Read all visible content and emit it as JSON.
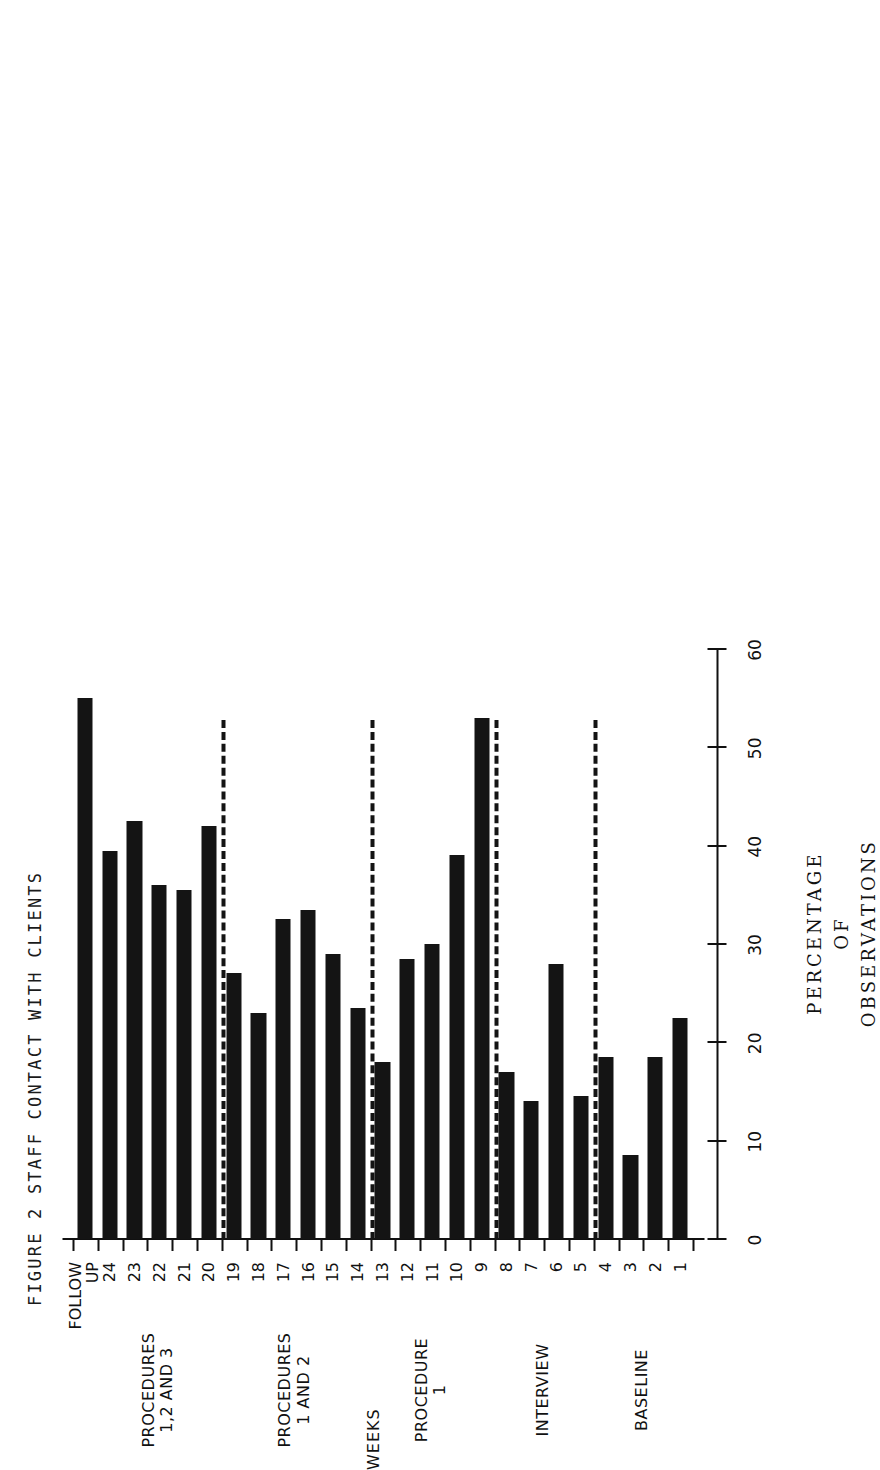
{
  "figure": {
    "title": "FIGURE 2  STAFF CONTACT WITH CLIENTS"
  },
  "chart_data": {
    "type": "bar",
    "title": "FIGURE 2  STAFF CONTACT WITH CLIENTS",
    "orientation": "vertical-bars-printed-sideways",
    "xlabel": "WEEKS",
    "ylabel": "PERCENTAGE OF OBSERVATIONS",
    "ylabel_lines": [
      "PERCENTAGE",
      "OF",
      "OBSERVATIONS"
    ],
    "ylim": [
      0,
      60
    ],
    "yticks": [
      0,
      10,
      20,
      30,
      40,
      50,
      60
    ],
    "ytick_labels": [
      "0",
      "10",
      "20",
      "30",
      "40",
      "50",
      "60"
    ],
    "grid": false,
    "legend": "none",
    "categories": [
      "1",
      "2",
      "3",
      "4",
      "5",
      "6",
      "7",
      "8",
      "9",
      "10",
      "11",
      "12",
      "13",
      "14",
      "15",
      "16",
      "17",
      "18",
      "19",
      "20",
      "21",
      "22",
      "23",
      "24",
      "FOLLOW UP"
    ],
    "values": [
      22.5,
      18.5,
      8.5,
      18.5,
      14.5,
      28,
      14,
      17,
      53,
      39,
      30,
      28.5,
      18,
      23.5,
      29,
      33.5,
      32.5,
      23,
      27,
      42,
      35.5,
      36,
      42.5,
      39.5,
      55
    ],
    "phases": [
      {
        "label": "BASELINE",
        "label_lines": [
          "BASELINE"
        ],
        "start_category": "1",
        "end_category": "4"
      },
      {
        "label": "INTERVIEW",
        "label_lines": [
          "INTERVIEW"
        ],
        "start_category": "5",
        "end_category": "8"
      },
      {
        "label": "PROCEDURE 1",
        "label_lines": [
          "PROCEDURE",
          "1"
        ],
        "start_category": "9",
        "end_category": "13"
      },
      {
        "label": "PROCEDURES 1 AND 2",
        "label_lines": [
          "PROCEDURES",
          "1 AND 2"
        ],
        "start_category": "14",
        "end_category": "19"
      },
      {
        "label": "PROCEDURES 1,2 AND 3",
        "label_lines": [
          "PROCEDURES",
          "1,2 AND 3"
        ],
        "start_category": "20",
        "end_category": "24"
      }
    ],
    "phase_dividers_after_category": [
      "4",
      "8",
      "13",
      "19"
    ],
    "colors": {
      "bar": "#141414",
      "axis": "#111111",
      "background": "#ffffff"
    }
  }
}
